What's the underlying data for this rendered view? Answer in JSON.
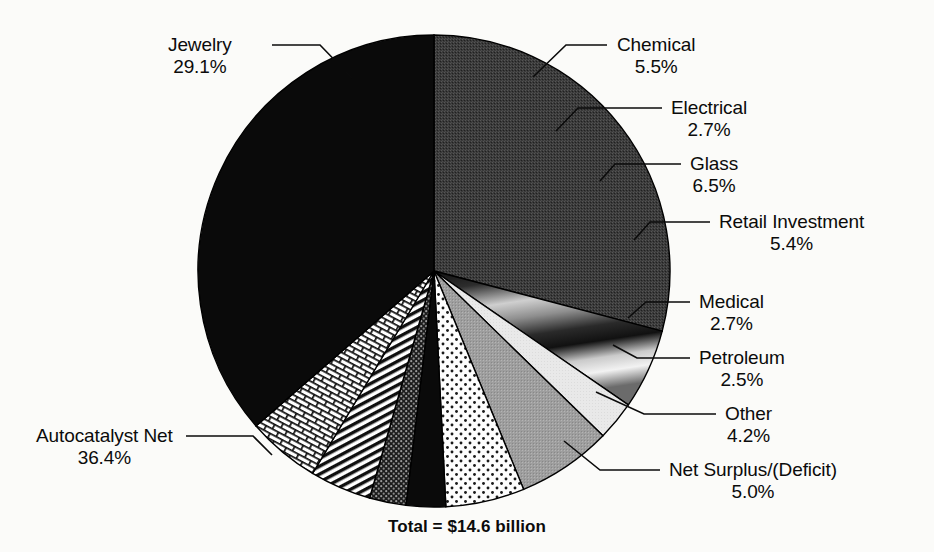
{
  "chart_data": {
    "type": "pie",
    "title": "Total = $14.6 billion",
    "xlabel": "",
    "ylabel": "",
    "legend_position": "callout-labels",
    "grid": false,
    "total_label": "Total = $14.6 billion",
    "total_value": 14.6,
    "total_units": "billion US dollars",
    "units": "percent",
    "start_angle_deg": -90,
    "direction": "clockwise",
    "categories": [
      "Jewelry",
      "Chemical",
      "Electrical",
      "Glass",
      "Retail Investment",
      "Medical",
      "Petroleum",
      "Other",
      "Net Surplus/(Deficit)",
      "Autocatalyst Net"
    ],
    "values": [
      29.1,
      5.5,
      2.7,
      6.5,
      5.4,
      2.7,
      2.5,
      4.2,
      5.0,
      36.4
    ],
    "slices": [
      {
        "name": "Jewelry",
        "value": 29.1,
        "value_label": "29.1%",
        "fill": "dark-gray-dither",
        "color": "#3c3c3c",
        "label_side": "left",
        "label_x": 168,
        "label_y": 34,
        "leader": [
          [
            272,
            45
          ],
          [
            320,
            45
          ],
          [
            352,
            78
          ]
        ]
      },
      {
        "name": "Chemical",
        "value": 5.5,
        "value_label": "5.5%",
        "fill": "gradient-dark-light",
        "color": "#8a8a8a",
        "label_side": "right",
        "label_x": 617,
        "label_y": 34,
        "leader": [
          [
            607,
            45
          ],
          [
            566,
            45
          ],
          [
            533,
            77
          ]
        ]
      },
      {
        "name": "Electrical",
        "value": 2.7,
        "value_label": "2.7%",
        "fill": "very-light-gray",
        "color": "#e6e6e6",
        "label_side": "right",
        "label_x": 671,
        "label_y": 97,
        "leader": [
          [
            662,
            108
          ],
          [
            578,
            108
          ],
          [
            556,
            131
          ]
        ]
      },
      {
        "name": "Glass",
        "value": 6.5,
        "value_label": "6.5%",
        "fill": "medium-gray",
        "color": "#9c9c9c",
        "label_side": "right",
        "label_x": 690,
        "label_y": 153,
        "leader": [
          [
            681,
            164
          ],
          [
            615,
            164
          ],
          [
            600,
            181
          ]
        ]
      },
      {
        "name": "Retail Investment",
        "value": 5.4,
        "value_label": "5.4%",
        "fill": "dotted-light",
        "color": "#f4f4f4",
        "label_side": "right",
        "label_x": 719,
        "label_y": 211,
        "leader": [
          [
            710,
            222
          ],
          [
            650,
            222
          ],
          [
            634,
            240
          ]
        ]
      },
      {
        "name": "Medical",
        "value": 2.7,
        "value_label": "2.7%",
        "fill": "solid-black",
        "color": "#0a0a0a",
        "label_side": "right",
        "label_x": 699,
        "label_y": 291,
        "leader": [
          [
            690,
            302
          ],
          [
            646,
            302
          ],
          [
            628,
            318
          ]
        ]
      },
      {
        "name": "Petroleum",
        "value": 2.5,
        "value_label": "2.5%",
        "fill": "dark-crosshatch",
        "color": "#2b2b2b",
        "label_side": "right",
        "label_x": 699,
        "label_y": 347,
        "leader": [
          [
            690,
            358
          ],
          [
            637,
            358
          ],
          [
            613,
            345
          ]
        ]
      },
      {
        "name": "Other",
        "value": 4.2,
        "value_label": "4.2%",
        "fill": "diagonal-stripes",
        "color": "#ffffff",
        "label_side": "right",
        "label_x": 725,
        "label_y": 403,
        "leader": [
          [
            716,
            414
          ],
          [
            644,
            414
          ],
          [
            596,
            392
          ]
        ]
      },
      {
        "name": "Net Surplus/(Deficit)",
        "value": 5.0,
        "value_label": "5.0%",
        "fill": "brick-weave",
        "color": "#ffffff",
        "label_side": "right",
        "label_x": 669,
        "label_y": 459,
        "leader": [
          [
            660,
            470
          ],
          [
            600,
            470
          ],
          [
            564,
            441
          ]
        ]
      },
      {
        "name": "Autocatalyst Net",
        "value": 36.4,
        "value_label": "36.4%",
        "fill": "solid-black",
        "color": "#0a0a0a",
        "label_side": "left",
        "label_x": 36,
        "label_y": 425,
        "leader": [
          [
            186,
            436
          ],
          [
            253,
            436
          ],
          [
            272,
            455
          ]
        ]
      }
    ]
  },
  "geometry": {
    "center_x": 434,
    "center_y": 271,
    "radius": 236
  }
}
